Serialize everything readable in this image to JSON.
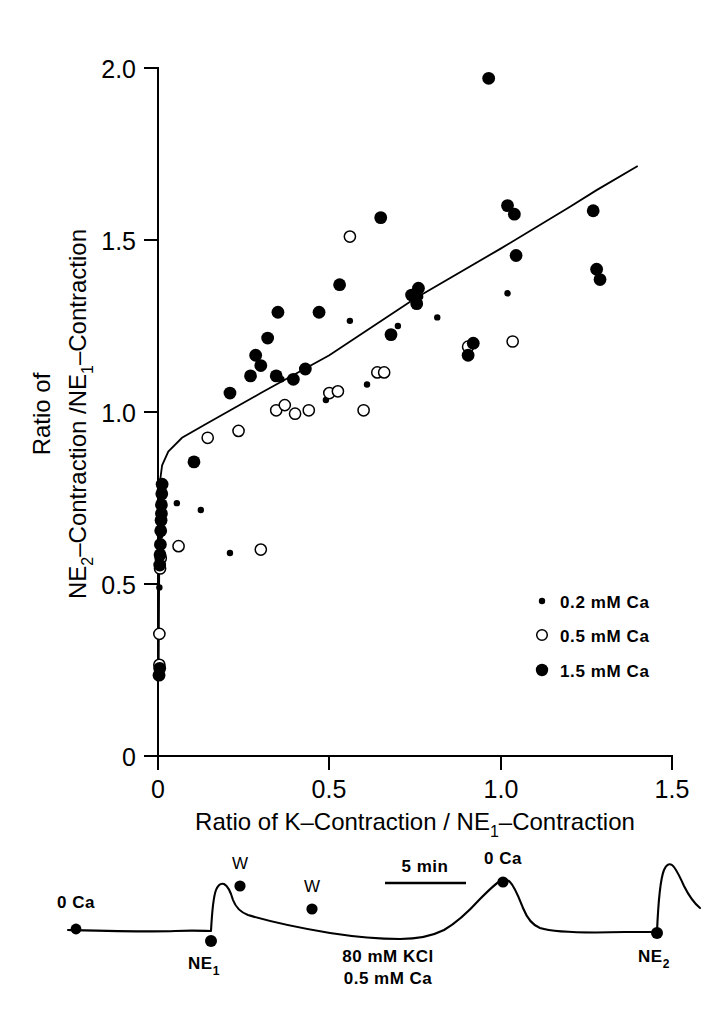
{
  "figure": {
    "title": "",
    "background": "#ffffff",
    "ink_color": "#000000"
  },
  "chart_data": {
    "type": "scatter",
    "title": "",
    "xlabel": "Ratio of K-Contraction / NE1-Contraction",
    "xlabel_parts": {
      "pre": "Ratio of K–Contraction / NE",
      "sub": "1",
      "post": "–Contraction"
    },
    "ylabel_line1": "Ratio of",
    "ylabel_line2_parts": {
      "pre": "NE",
      "sub1": "2",
      "mid": "–Contraction /NE",
      "sub2": "1",
      "post": "–Contraction"
    },
    "ylabel": "Ratio of NE2-Contraction /NE1-Contraction",
    "xlim": [
      0,
      1.5
    ],
    "ylim": [
      0,
      2.0
    ],
    "xticks": [
      0,
      0.5,
      1.0,
      1.5
    ],
    "xtick_labels": [
      "0",
      "0.5",
      "1.0",
      "1.5"
    ],
    "yticks": [
      0,
      0.5,
      1.0,
      1.5,
      2.0
    ],
    "ytick_labels": [
      "0",
      "0.5",
      "1.0",
      "1.5",
      "2.0"
    ],
    "grid": false,
    "legend_position": "lower-right-inside",
    "fit_line": {
      "description": "hockey-stick fit: steep rise near x=0 then linear",
      "points": [
        [
          0.002,
          0.27
        ],
        [
          0.004,
          0.62
        ],
        [
          0.006,
          0.8
        ],
        [
          0.012,
          0.845
        ],
        [
          0.03,
          0.885
        ],
        [
          0.07,
          0.925
        ],
        [
          0.14,
          0.965
        ],
        [
          0.3,
          1.055
        ],
        [
          0.5,
          1.165
        ],
        [
          0.75,
          1.33
        ],
        [
          1.0,
          1.475
        ],
        [
          1.2,
          1.595
        ],
        [
          1.28,
          1.645
        ],
        [
          1.4,
          1.715
        ]
      ]
    },
    "series": [
      {
        "name": "0.2  mM Ca",
        "marker": "small-filled-circle",
        "marker_radius": 3.2,
        "color": "#000000",
        "points": [
          [
            0.004,
            0.49
          ],
          [
            0.006,
            0.64
          ],
          [
            0.01,
            0.755
          ],
          [
            0.055,
            0.735
          ],
          [
            0.125,
            0.715
          ],
          [
            0.21,
            0.59
          ],
          [
            0.36,
            1.095
          ],
          [
            0.49,
            1.035
          ],
          [
            0.56,
            1.265
          ],
          [
            0.61,
            1.08
          ],
          [
            0.7,
            1.25
          ],
          [
            0.765,
            1.335
          ],
          [
            0.815,
            1.275
          ],
          [
            1.02,
            1.345
          ]
        ]
      },
      {
        "name": "0.5  mM Ca",
        "marker": "open-circle",
        "marker_radius": 5.6,
        "color": "#000000",
        "points": [
          [
            0.004,
            0.265
          ],
          [
            0.004,
            0.355
          ],
          [
            0.006,
            0.545
          ],
          [
            0.008,
            0.575
          ],
          [
            0.06,
            0.61
          ],
          [
            0.145,
            0.925
          ],
          [
            0.235,
            0.945
          ],
          [
            0.3,
            0.6
          ],
          [
            0.345,
            1.005
          ],
          [
            0.37,
            1.02
          ],
          [
            0.4,
            0.995
          ],
          [
            0.44,
            1.005
          ],
          [
            0.5,
            1.055
          ],
          [
            0.525,
            1.06
          ],
          [
            0.56,
            1.51
          ],
          [
            0.6,
            1.005
          ],
          [
            0.64,
            1.115
          ],
          [
            0.66,
            1.115
          ],
          [
            0.905,
            1.19
          ],
          [
            1.035,
            1.205
          ]
        ]
      },
      {
        "name": "1.5  mM Ca",
        "marker": "large-filled-circle",
        "marker_radius": 6.4,
        "color": "#000000",
        "points": [
          [
            0.003,
            0.235
          ],
          [
            0.005,
            0.255
          ],
          [
            0.005,
            0.555
          ],
          [
            0.006,
            0.585
          ],
          [
            0.007,
            0.615
          ],
          [
            0.008,
            0.655
          ],
          [
            0.009,
            0.685
          ],
          [
            0.01,
            0.705
          ],
          [
            0.01,
            0.73
          ],
          [
            0.011,
            0.762
          ],
          [
            0.012,
            0.79
          ],
          [
            0.105,
            0.855
          ],
          [
            0.21,
            1.055
          ],
          [
            0.27,
            1.105
          ],
          [
            0.285,
            1.165
          ],
          [
            0.3,
            1.135
          ],
          [
            0.32,
            1.215
          ],
          [
            0.345,
            1.105
          ],
          [
            0.35,
            1.29
          ],
          [
            0.395,
            1.095
          ],
          [
            0.43,
            1.125
          ],
          [
            0.47,
            1.29
          ],
          [
            0.53,
            1.37
          ],
          [
            0.65,
            1.565
          ],
          [
            0.68,
            1.225
          ],
          [
            0.74,
            1.34
          ],
          [
            0.755,
            1.315
          ],
          [
            0.76,
            1.36
          ],
          [
            0.905,
            1.165
          ],
          [
            0.92,
            1.2
          ],
          [
            0.965,
            1.97
          ],
          [
            1.02,
            1.6
          ],
          [
            1.04,
            1.575
          ],
          [
            1.045,
            1.455
          ],
          [
            1.27,
            1.585
          ],
          [
            1.28,
            1.415
          ],
          [
            1.29,
            1.385
          ]
        ]
      }
    ],
    "legend": [
      {
        "label": "0.2  mM Ca",
        "marker": "small-filled-circle"
      },
      {
        "label": "0.5  mM Ca",
        "marker": "open-circle"
      },
      {
        "label": "1.5  mM Ca",
        "marker": "large-filled-circle"
      }
    ]
  },
  "trace_panel": {
    "description": "Representative contraction recording trace",
    "scalebar_label": "5 min",
    "annotations": [
      {
        "name": "zero-ca-start",
        "text": "0 Ca"
      },
      {
        "name": "ne1-marker",
        "text_main": "NE",
        "text_sub": "1"
      },
      {
        "name": "wash-marker-1",
        "text": "W"
      },
      {
        "name": "wash-marker-2",
        "text": "W"
      },
      {
        "name": "kcl-line1",
        "text": "80 mM KCl"
      },
      {
        "name": "kcl-line2",
        "text": "0.5 mM Ca"
      },
      {
        "name": "zero-ca-peak",
        "text": "0 Ca"
      },
      {
        "name": "ne2-marker",
        "text_main": "NE",
        "text_sub": "2"
      }
    ]
  }
}
